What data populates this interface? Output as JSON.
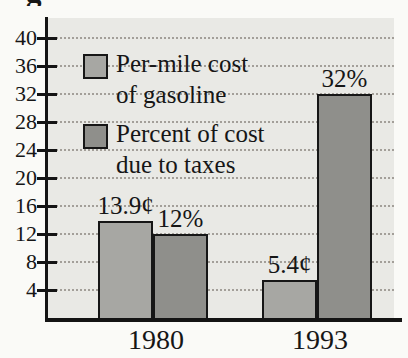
{
  "page": {
    "cropped_title_fragment": "g"
  },
  "colors": {
    "per_mile": "#a7a7a3",
    "percent": "#8f8f8b",
    "plot_bg": "#e9e9e5",
    "axis": "#141414",
    "grid": "#a39f99"
  },
  "chart_data": {
    "type": "bar",
    "categories": [
      "1980",
      "1993"
    ],
    "series": [
      {
        "name": "Per-mile cost of gasoline",
        "values": [
          13.9,
          5.4
        ],
        "labels": [
          "13.9¢",
          "5.4¢"
        ],
        "color_key": "per_mile"
      },
      {
        "name": "Percent of cost due to taxes",
        "values": [
          12,
          32
        ],
        "labels": [
          "12%",
          "32%"
        ],
        "color_key": "percent"
      }
    ],
    "ylabel": "",
    "xlabel": "",
    "ylim": [
      0,
      42
    ],
    "yticks": [
      4,
      8,
      12,
      16,
      20,
      24,
      28,
      32,
      36,
      40
    ],
    "grid": true,
    "legend_position": "upper-left-inside",
    "legend": [
      {
        "label_lines": [
          "Per-mile cost",
          "of gasoline"
        ],
        "color_key": "per_mile"
      },
      {
        "label_lines": [
          "Percent of cost",
          "due to taxes"
        ],
        "color_key": "percent"
      }
    ]
  }
}
